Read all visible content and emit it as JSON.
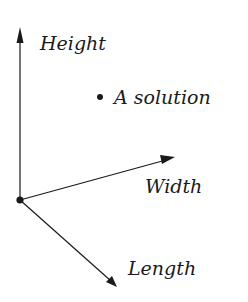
{
  "diagram": {
    "title": "",
    "axes": [
      {
        "name": "height",
        "label": "Height"
      },
      {
        "name": "width",
        "label": "Width"
      },
      {
        "name": "length",
        "label": "Length"
      }
    ],
    "point": {
      "label": "A solution"
    },
    "colors": {
      "stroke": "#1a1a1a",
      "background": "#ffffff"
    }
  }
}
